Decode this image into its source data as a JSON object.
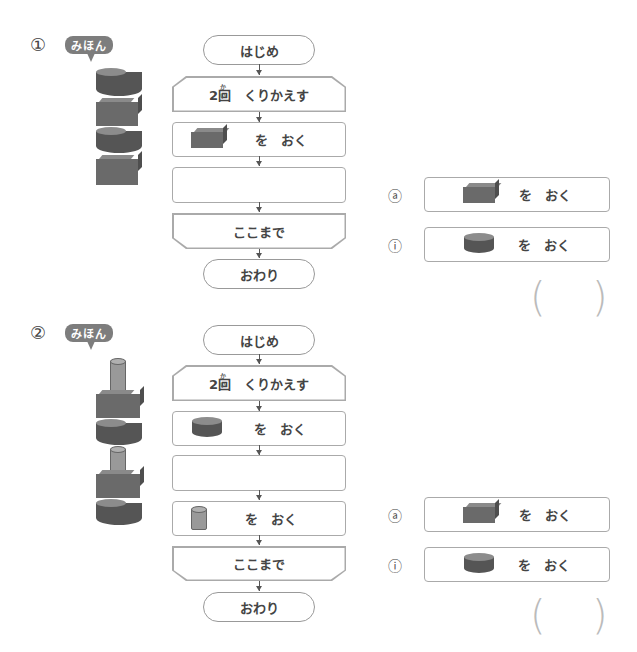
{
  "problems": [
    {
      "number": "①",
      "sample_label": "みほん",
      "sample_stack": [
        "cylinder",
        "cube",
        "cylinder",
        "cube"
      ],
      "flow": {
        "start": "はじめ",
        "loop_count": "2",
        "loop_kanji": "回",
        "loop_ruby": "かい",
        "loop_text": "くりかえす",
        "step1_text": "を　おく",
        "step1_shape": "cube",
        "blank": "",
        "loop_end": "ここまで",
        "end": "おわり"
      },
      "choices": [
        {
          "mark": "あ",
          "shape": "cube",
          "text": "を　おく"
        },
        {
          "mark": "い",
          "shape": "cylinder",
          "text": "を　おく"
        }
      ],
      "answer_open": "(",
      "answer_close": ")"
    },
    {
      "number": "②",
      "sample_label": "みほん",
      "sample_stack": [
        "rod",
        "cube",
        "cylinder",
        "rod",
        "cube",
        "cylinder"
      ],
      "flow": {
        "start": "はじめ",
        "loop_count": "2",
        "loop_kanji": "回",
        "loop_ruby": "かい",
        "loop_text": "くりかえす",
        "step1_text": "を　おく",
        "step1_shape": "cylinder",
        "blank": "",
        "step3_text": "を　おく",
        "step3_shape": "rod",
        "loop_end": "ここまで",
        "end": "おわり"
      },
      "choices": [
        {
          "mark": "あ",
          "shape": "cube",
          "text": "を　おく"
        },
        {
          "mark": "い",
          "shape": "cylinder",
          "text": "を　おく"
        }
      ],
      "answer_open": "(",
      "answer_close": ")"
    }
  ]
}
